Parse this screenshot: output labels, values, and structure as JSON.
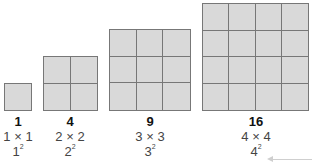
{
  "squares": [
    {
      "n": 1,
      "count": "1",
      "expression": "1 × 1",
      "base": "1",
      "exponent": "2"
    },
    {
      "n": 2,
      "count": "4",
      "expression": "2 × 2",
      "base": "2",
      "exponent": "2"
    },
    {
      "n": 3,
      "count": "9",
      "expression": "3 × 3",
      "base": "3",
      "exponent": "2"
    },
    {
      "n": 4,
      "count": "16",
      "expression": "4 × 4",
      "base": "4",
      "exponent": "2"
    }
  ],
  "colors": {
    "cell_fill": "#d9d9d9",
    "grid_line": "#777777",
    "arrow": "#cfcfcf"
  },
  "annotation": {
    "arrow_points_to": "4²"
  }
}
